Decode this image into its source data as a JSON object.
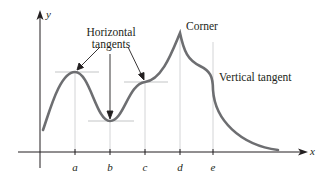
{
  "diagram": {
    "axes": {
      "x_label": "x",
      "y_label": "y"
    },
    "ticks": [
      {
        "label": "a",
        "x": 75
      },
      {
        "label": "b",
        "x": 110
      },
      {
        "label": "c",
        "x": 145
      },
      {
        "label": "d",
        "x": 180
      },
      {
        "label": "e",
        "x": 213
      }
    ],
    "annotations": {
      "horizontal_line1": "Horizontal",
      "horizontal_line2": "tangents",
      "corner": "Corner",
      "vertical_tangent": "Vertical tangent"
    },
    "colors": {
      "curve": "#6d6e71",
      "axes": "#231f20",
      "guides": "#bcbec0",
      "text": "#231f20"
    }
  }
}
